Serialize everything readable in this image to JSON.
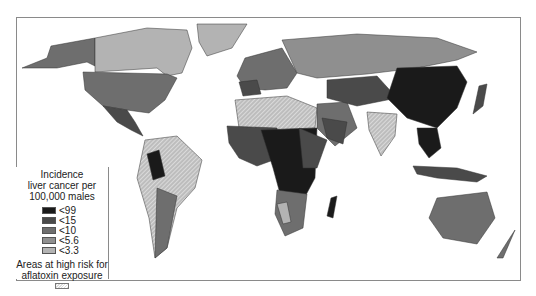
{
  "legend": {
    "title_line1": "Incidence",
    "title_line2": "liver cancer per",
    "title_line3": "100,000 males",
    "categories": [
      {
        "label": "<99",
        "color": "#1a1a1a"
      },
      {
        "label": "<15",
        "color": "#4a4a4a"
      },
      {
        "label": "<10",
        "color": "#6e6e6e"
      },
      {
        "label": "<5.6",
        "color": "#8f8f8f"
      },
      {
        "label": "<3.3",
        "color": "#b3b3b3"
      }
    ],
    "risk_line1": "Areas at high risk for",
    "risk_line2": "aflatoxin exposure",
    "risk_pattern": "hatched"
  },
  "map": {
    "type": "choropleth world map",
    "colors": {
      "ocean": "#ffffff",
      "border": "#333333",
      "frame": "#8a8a8a"
    }
  }
}
